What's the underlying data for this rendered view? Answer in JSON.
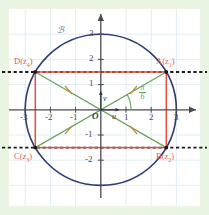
{
  "figure": {
    "kind": "complex-plane-diagram",
    "background_color": "#eaf5e4",
    "plot_background_color": "#ffffff",
    "grid_color": "#dfe8f2",
    "axis_color": "#4a4a52",
    "circle_color": "#2c3c74",
    "rectangle_color": "#e0503c",
    "diagonal_color": "#6aa45f",
    "dashed_color": "#1a1a1a",
    "point_label_color": "#d4635a"
  },
  "curve": {
    "label": "ℬ"
  },
  "origin": {
    "label": "O"
  },
  "axes": {
    "x_ticks": [
      {
        "value": -3,
        "label": "-3"
      },
      {
        "value": -2,
        "label": "-2"
      },
      {
        "value": -1,
        "label": "-1"
      },
      {
        "value": 1,
        "label": "1"
      },
      {
        "value": 2,
        "label": "2"
      },
      {
        "value": 3,
        "label": "3"
      }
    ],
    "y_ticks": [
      {
        "value": 3,
        "label": "3"
      },
      {
        "value": 2,
        "label": "2"
      },
      {
        "value": 1,
        "label": "1"
      },
      {
        "value": -1,
        "label": "-1"
      },
      {
        "value": -2,
        "label": "-2"
      }
    ],
    "xlim": [
      -3.8,
      3.8
    ],
    "ylim": [
      -3.6,
      3.6
    ]
  },
  "vectors": [
    {
      "name": "u",
      "label": "u",
      "direction": "right"
    },
    {
      "name": "v",
      "label": "v",
      "direction": "up"
    }
  ],
  "angle": {
    "numerator": "π",
    "denominator": "6",
    "value_radians": 0.5236
  },
  "circle": {
    "center": [
      0,
      0
    ],
    "radius": 3
  },
  "points": [
    {
      "id": "A",
      "label": "A(z",
      "sub": "1",
      "close": ")",
      "x": 2.598,
      "y": 1.5
    },
    {
      "id": "B",
      "label": "B(z",
      "sub": "2",
      "close": ")",
      "x": 2.598,
      "y": -1.5
    },
    {
      "id": "C",
      "label": "C(z",
      "sub": "3",
      "close": ")",
      "x": -2.598,
      "y": -1.5
    },
    {
      "id": "D",
      "label": "D(z",
      "sub": "4",
      "close": ")",
      "x": -2.598,
      "y": 1.5
    }
  ],
  "dashed_lines": [
    {
      "y": 1.5,
      "from_x": -3.8,
      "to_x": 3.8
    },
    {
      "y": -1.5,
      "from_x": -3.8,
      "to_x": 3.8
    }
  ]
}
